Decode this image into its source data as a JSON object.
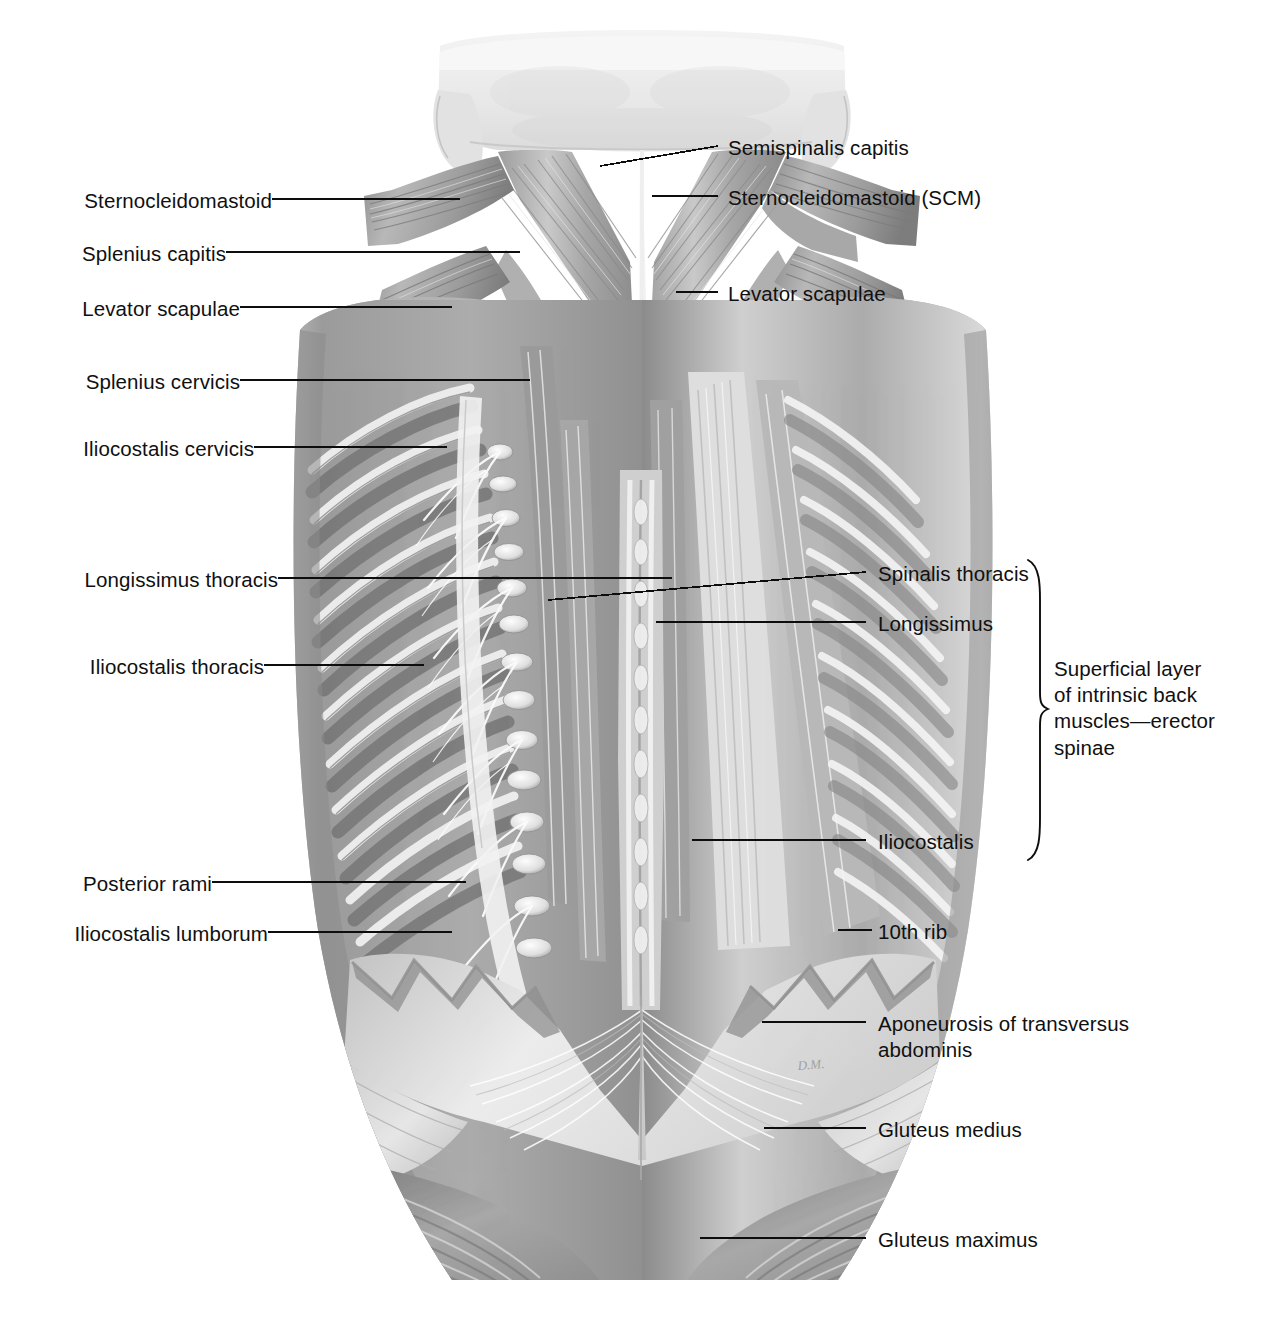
{
  "figure": {
    "view": "posterior view of neck, back, and gluteal region",
    "artist_signature": "D.M.",
    "background_color": "#ffffff",
    "line_color": "#0d0d0d",
    "text_color": "#101010"
  },
  "labels_left": [
    {
      "id": "sternocleidomastoid",
      "text": "Sternocleidomastoid"
    },
    {
      "id": "splenius-capitis",
      "text": "Splenius capitis"
    },
    {
      "id": "levator-scapulae-left",
      "text": "Levator scapulae"
    },
    {
      "id": "splenius-cervicis",
      "text": "Splenius cervicis"
    },
    {
      "id": "iliocostalis-cervicis",
      "text": "Iliocostalis cervicis"
    },
    {
      "id": "longissimus-thoracis",
      "text": "Longissimus thoracis"
    },
    {
      "id": "iliocostalis-thoracis",
      "text": "Iliocostalis thoracis"
    },
    {
      "id": "posterior-rami",
      "text": "Posterior rami"
    },
    {
      "id": "iliocostalis-lumborum",
      "text": "Iliocostalis lumborum"
    }
  ],
  "labels_right": [
    {
      "id": "semispinalis-capitis",
      "text": "Semispinalis capitis"
    },
    {
      "id": "sternocleidomastoid-scm",
      "text": "Sternocleidomastoid (SCM)"
    },
    {
      "id": "levator-scapulae-right",
      "text": "Levator scapulae"
    },
    {
      "id": "spinalis-thoracis",
      "text": "Spinalis thoracis"
    },
    {
      "id": "longissimus",
      "text": "Longissimus"
    },
    {
      "id": "iliocostalis",
      "text": "Iliocostalis"
    },
    {
      "id": "tenth-rib",
      "text": "10th rib"
    },
    {
      "id": "aponeurosis-transversus-abdominis",
      "text": "Aponeurosis of transversus\nabdominis"
    },
    {
      "id": "gluteus-medius",
      "text": "Gluteus medius"
    },
    {
      "id": "gluteus-maximus",
      "text": "Gluteus maximus"
    }
  ],
  "bracket": {
    "id": "erector-spinae-bracket",
    "text": "Superficial layer\nof intrinsic back\nmuscles—erector\nspinae",
    "groups": [
      "Spinalis thoracis",
      "Longissimus",
      "Iliocostalis"
    ]
  }
}
